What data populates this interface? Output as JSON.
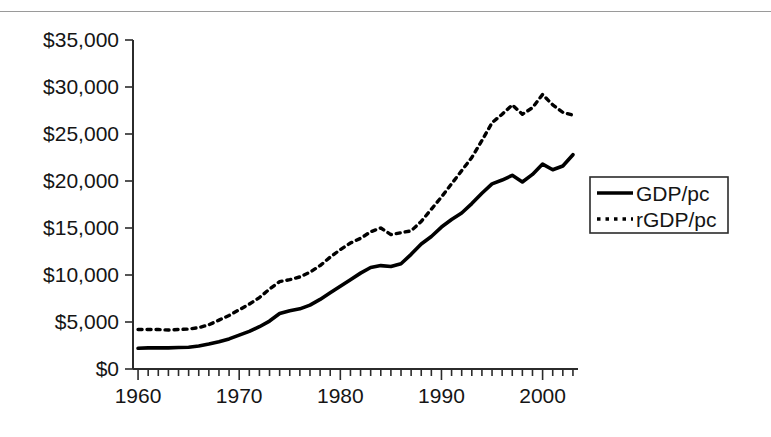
{
  "page": {
    "clipped_header_text": ""
  },
  "chart_data": {
    "type": "line",
    "title": "",
    "subtitle": "",
    "xlabel": "",
    "ylabel": "",
    "xlim": [
      1959.5,
      2003.5
    ],
    "ylim": [
      0,
      35000
    ],
    "grid": false,
    "legend_position": "right",
    "y_ticks": [
      0,
      5000,
      10000,
      15000,
      20000,
      25000,
      30000,
      35000
    ],
    "y_tick_labels": [
      "$0",
      "$5,000",
      "$10,000",
      "$15,000",
      "$20,000",
      "$25,000",
      "$30,000",
      "$35,000"
    ],
    "x_ticks": [
      1960,
      1970,
      1980,
      1990,
      2000
    ],
    "x_tick_labels": [
      "1960",
      "1970",
      "1980",
      "1990",
      "2000"
    ],
    "x_minor_tick_interval": 1,
    "x": [
      1960,
      1961,
      1962,
      1963,
      1964,
      1965,
      1966,
      1967,
      1968,
      1969,
      1970,
      1971,
      1972,
      1973,
      1974,
      1975,
      1976,
      1977,
      1978,
      1979,
      1980,
      1981,
      1982,
      1983,
      1984,
      1985,
      1986,
      1987,
      1988,
      1989,
      1990,
      1991,
      1992,
      1993,
      1994,
      1995,
      1996,
      1997,
      1998,
      1999,
      2000,
      2001,
      2002,
      2003
    ],
    "series": [
      {
        "name": "GDP/pc",
        "style": "solid",
        "color": "#000000",
        "values": [
          2200,
          2250,
          2250,
          2250,
          2280,
          2320,
          2450,
          2650,
          2900,
          3200,
          3600,
          4000,
          4500,
          5100,
          5900,
          6200,
          6400,
          6800,
          7400,
          8100,
          8800,
          9500,
          10200,
          10800,
          11000,
          10900,
          11200,
          12200,
          13300,
          14100,
          15100,
          15900,
          16600,
          17600,
          18700,
          19700,
          20100,
          20600,
          19900,
          20700,
          21800,
          21200,
          21600,
          22800
        ]
      },
      {
        "name": "rGDP/pc",
        "style": "dotted",
        "color": "#000000",
        "values": [
          4200,
          4200,
          4200,
          4150,
          4200,
          4250,
          4400,
          4700,
          5200,
          5700,
          6300,
          6900,
          7600,
          8500,
          9300,
          9500,
          9800,
          10300,
          11000,
          11900,
          12700,
          13400,
          13900,
          14600,
          15000,
          14300,
          14500,
          14700,
          15700,
          17000,
          18300,
          19700,
          21100,
          22500,
          24300,
          26200,
          27100,
          28100,
          27100,
          27800,
          29200,
          28100,
          27300,
          27000
        ]
      }
    ],
    "legend": [
      {
        "label": "GDP/pc",
        "style": "solid"
      },
      {
        "label": "rGDP/pc",
        "style": "dotted"
      }
    ]
  }
}
